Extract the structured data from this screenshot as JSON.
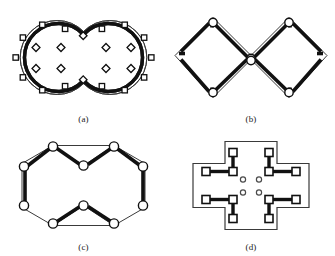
{
  "figure": {
    "background_color": "#ffffff",
    "ink_color": "#1a1a1a",
    "thick_member_color": "#111111",
    "outline_color": "#3a3a3a",
    "node_fill_color": "#ffffff",
    "panels": [
      {
        "key": "a",
        "caption": "(a)",
        "description": "two fused circles with thick circumferential rings, square boundary nodes and inner diamond nodes",
        "outline_shape": "double-circle",
        "boundary_node_shape": "square",
        "boundary_node_count": 16,
        "inner_node_shape": "diamond",
        "inner_node_count": 8
      },
      {
        "key": "b",
        "caption": "(b)",
        "description": "double diamond zigzag outline with thick inner chord members and circular nodes",
        "outline_shape": "double-diamond",
        "boundary_node_shape": "circle",
        "boundary_node_count": 6,
        "inner_node_shape": "none",
        "inner_node_count": 0
      },
      {
        "key": "c",
        "caption": "(c)",
        "description": "fused double hexagon outline with thick chord members and circular nodes at vertices",
        "outline_shape": "double-hexagon",
        "boundary_node_shape": "circle",
        "boundary_node_count": 10,
        "inner_node_shape": "none",
        "inner_node_count": 0
      },
      {
        "key": "d",
        "caption": "(d)",
        "description": "cross shaped outline with four L-shaped thick connector assemblies of square nodes and four small circular inner nodes",
        "outline_shape": "cross",
        "boundary_node_shape": "square",
        "boundary_node_count": 12,
        "inner_node_shape": "circle",
        "inner_node_count": 4
      }
    ]
  }
}
